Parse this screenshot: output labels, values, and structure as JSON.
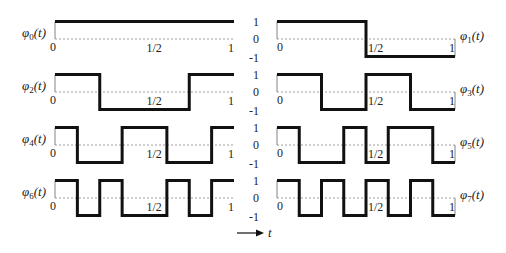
{
  "axis": {
    "arrow_label": "t",
    "y_ticks": [
      "1",
      "0",
      "-1"
    ],
    "x_ticks": [
      "0",
      "1/2",
      "1"
    ]
  },
  "functions": [
    {
      "name": "φ",
      "index": "0",
      "arg": "(t)",
      "signs": [
        1,
        1,
        1,
        1,
        1,
        1,
        1,
        1
      ]
    },
    {
      "name": "φ",
      "index": "1",
      "arg": "(t)",
      "signs": [
        1,
        1,
        1,
        1,
        -1,
        -1,
        -1,
        -1
      ]
    },
    {
      "name": "φ",
      "index": "2",
      "arg": "(t)",
      "signs": [
        1,
        1,
        -1,
        -1,
        -1,
        -1,
        1,
        1
      ]
    },
    {
      "name": "φ",
      "index": "3",
      "arg": "(t)",
      "signs": [
        1,
        1,
        -1,
        -1,
        1,
        1,
        -1,
        -1
      ]
    },
    {
      "name": "φ",
      "index": "4",
      "arg": "(t)",
      "signs": [
        1,
        -1,
        -1,
        1,
        1,
        -1,
        -1,
        1
      ]
    },
    {
      "name": "φ",
      "index": "5",
      "arg": "(t)",
      "signs": [
        1,
        -1,
        -1,
        1,
        -1,
        1,
        1,
        -1
      ]
    },
    {
      "name": "φ",
      "index": "6",
      "arg": "(t)",
      "signs": [
        1,
        -1,
        1,
        -1,
        -1,
        1,
        -1,
        1
      ]
    },
    {
      "name": "φ",
      "index": "7",
      "arg": "(t)",
      "signs": [
        1,
        -1,
        1,
        -1,
        1,
        -1,
        1,
        -1
      ]
    }
  ],
  "colors": {
    "wave": "#111111",
    "zero_line": "#888888"
  }
}
